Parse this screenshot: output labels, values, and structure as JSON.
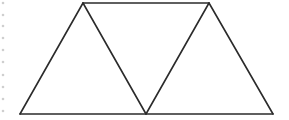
{
  "diagram": {
    "stroke_color": "#2b2b2b",
    "dot_color": "#cfcfcf",
    "vertices": {
      "top_left": [
        83,
        3
      ],
      "top_right": [
        209,
        3
      ],
      "bottom_left": [
        20,
        114
      ],
      "bottom_mid": [
        146,
        114
      ],
      "bottom_right": [
        273,
        114
      ]
    },
    "segments": [
      [
        "top_left",
        "top_right"
      ],
      [
        "bottom_left",
        "bottom_right"
      ],
      [
        "bottom_left",
        "top_left"
      ],
      [
        "top_left",
        "bottom_mid"
      ],
      [
        "bottom_mid",
        "top_right"
      ],
      [
        "top_right",
        "bottom_right"
      ]
    ],
    "margin_dots": {
      "x": 3,
      "y": [
        3,
        15,
        26,
        38,
        50,
        62,
        75,
        87,
        99,
        111
      ]
    }
  }
}
